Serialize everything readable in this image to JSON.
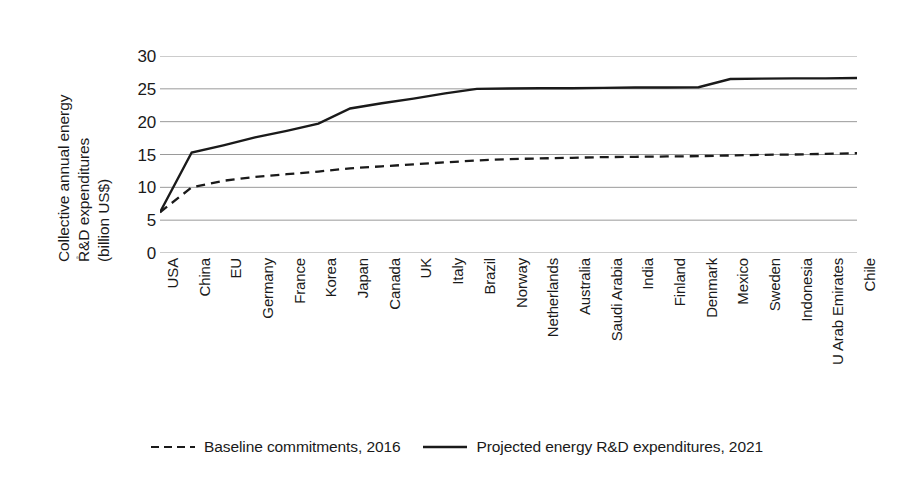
{
  "chart_data": {
    "type": "line",
    "title": "",
    "subtitle": "",
    "xlabel": "",
    "ylabel": "Collective annual energy R&D expenditures (billion US$)",
    "ylabel_lines": [
      "Collective annual energy",
      "R&D expenditures",
      "(billion US$)"
    ],
    "ylim": [
      0,
      30
    ],
    "yticks": [
      0,
      5,
      10,
      15,
      20,
      25,
      30
    ],
    "ytick_labels": [
      "0",
      "5",
      "10",
      "15",
      "20",
      "25",
      "30"
    ],
    "grid": true,
    "grid_axis": "y",
    "legend_position": "bottom",
    "categories": [
      "USA",
      "China",
      "EU",
      "Germany",
      "France",
      "Korea",
      "Japan",
      "Canada",
      "UK",
      "Italy",
      "Brazil",
      "Norway",
      "Netherlands",
      "Australia",
      "Saudi Arabia",
      "India",
      "Finland",
      "Denmark",
      "Mexico",
      "Sweden",
      "Indonesia",
      "U Arab Emirates",
      "Chile"
    ],
    "series": [
      {
        "name": "Baseline commitments, 2016",
        "style": "dashed",
        "color": "#1a1a1a",
        "values": [
          6.2,
          10.0,
          11.0,
          11.6,
          12.0,
          12.4,
          12.9,
          13.2,
          13.5,
          13.8,
          14.1,
          14.3,
          14.4,
          14.5,
          14.6,
          14.65,
          14.7,
          14.75,
          14.85,
          14.95,
          15.0,
          15.1,
          15.2
        ]
      },
      {
        "name": "Projected energy R&D expenditures, 2021",
        "style": "solid",
        "color": "#1a1a1a",
        "values": [
          6.2,
          15.3,
          16.4,
          17.6,
          18.6,
          19.7,
          22.0,
          22.8,
          23.5,
          24.3,
          25.0,
          25.05,
          25.1,
          25.1,
          25.15,
          25.2,
          25.2,
          25.25,
          26.5,
          26.55,
          26.6,
          26.6,
          26.65
        ]
      }
    ]
  },
  "legend": {
    "items": [
      {
        "label": "Baseline commitments, 2016",
        "style": "dashed"
      },
      {
        "label": "Projected energy R&D expenditures, 2021",
        "style": "solid"
      }
    ]
  },
  "colors": {
    "line": "#1a1a1a",
    "grid": "#9a9a9a",
    "text": "#1a1a1a",
    "background": "#ffffff"
  }
}
